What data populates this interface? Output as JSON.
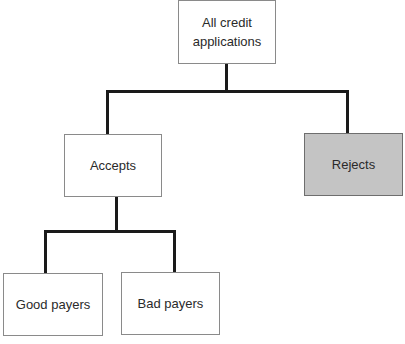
{
  "diagram": {
    "type": "tree",
    "root": {
      "label": "All credit applications",
      "line1": "All credit",
      "line2": "applications"
    },
    "level1": [
      {
        "label": "Accepts",
        "shaded": false
      },
      {
        "label": "Rejects",
        "shaded": true,
        "fill": "#c4c4c4"
      }
    ],
    "level2": [
      {
        "label": "Good payers",
        "parent": "Accepts"
      },
      {
        "label": "Bad payers",
        "parent": "Accepts"
      }
    ]
  }
}
